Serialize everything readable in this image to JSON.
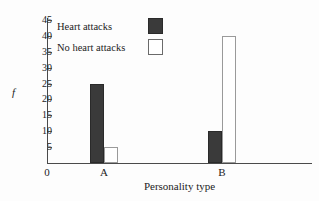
{
  "chart_data": {
    "type": "bar",
    "title": "",
    "xlabel": "Personality type",
    "ylabel": "f",
    "categories": [
      "A",
      "B"
    ],
    "series": [
      {
        "name": "Heart attacks",
        "values": [
          25,
          10
        ],
        "color": "#3a3a3a"
      },
      {
        "name": "No heart attacks",
        "values": [
          5,
          40
        ],
        "color": "#ffffff"
      }
    ],
    "ylim": [
      0,
      45
    ],
    "ytick_labels": [
      "0",
      "5",
      "10",
      "15",
      "20",
      "25",
      "30",
      "35",
      "40",
      "45"
    ],
    "ytick_values": [
      0,
      5,
      10,
      15,
      20,
      25,
      30,
      35,
      40,
      45
    ],
    "origin_label": "0",
    "grid": false,
    "legend_position": "top-left-inside"
  },
  "legend": {
    "items": [
      {
        "label": "Heart attacks",
        "swatch": "dark-swatch"
      },
      {
        "label": "No heart attacks",
        "swatch": "light-swatch"
      }
    ]
  },
  "axes": {
    "y_title": "f",
    "x_title": "Personality type",
    "origin": "0"
  }
}
